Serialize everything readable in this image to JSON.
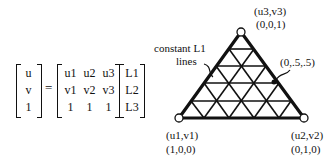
{
  "equation": {
    "lhs": [
      "u",
      "v",
      "1"
    ],
    "equals": "=",
    "matrix": [
      [
        "u1",
        "u2",
        "u3"
      ],
      [
        "v1",
        "v2",
        "v3"
      ],
      [
        "1",
        "1",
        "1"
      ]
    ],
    "rhs": [
      "L1",
      "L2",
      "L3"
    ]
  },
  "diagram": {
    "vertices": [
      {
        "name": "top",
        "coord": "(u3,v3)",
        "bary": "(0,0,1)"
      },
      {
        "name": "bottom-left",
        "coord": "(u1,v1)",
        "bary": "(1,0,0)"
      },
      {
        "name": "bottom-right",
        "coord": "(u2,v2)",
        "bary": "(0,1,0)"
      }
    ],
    "annotation_lines": "constant L1\nlines",
    "annotation_line1": "constant L1",
    "annotation_line2": "lines",
    "midpoint_label": "(0,.5,.5)",
    "subdivisions": 5
  }
}
